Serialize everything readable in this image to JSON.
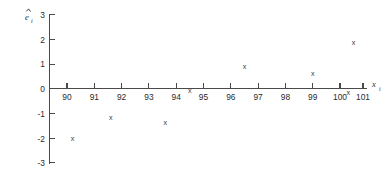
{
  "chart_data": {
    "type": "scatter",
    "title": "",
    "subtitle": "",
    "xlabel": "x",
    "xlabel_sub": "i",
    "ylabel": "e",
    "ylabel_sub": "i",
    "ylabel_accent": "hat",
    "xlim": [
      89.3,
      101.4
    ],
    "ylim": [
      -3,
      3
    ],
    "xticks": [
      90,
      91,
      92,
      93,
      94,
      95,
      96,
      97,
      98,
      99,
      100,
      101
    ],
    "xticklabels": [
      "90",
      "91",
      "92",
      "93",
      "94",
      "95",
      "96",
      "97",
      "98",
      "99",
      "100",
      "101"
    ],
    "yticks": [
      3,
      2,
      1,
      0,
      -1,
      -2,
      -3
    ],
    "yticklabels": [
      "3",
      "2",
      "1",
      "0",
      "-1",
      "-2",
      "-3"
    ],
    "grid": false,
    "legend": null,
    "marker": "x",
    "marker_color": "#3a3a3a",
    "axis_color": "#4a4a4a",
    "background": "#ffffff",
    "points": [
      {
        "x": 90.2,
        "y": -2.05
      },
      {
        "x": 91.6,
        "y": -1.2
      },
      {
        "x": 93.6,
        "y": -1.4
      },
      {
        "x": 94.5,
        "y": -0.12
      },
      {
        "x": 96.5,
        "y": 0.88
      },
      {
        "x": 99.0,
        "y": 0.57
      },
      {
        "x": 100.3,
        "y": -0.18
      },
      {
        "x": 100.5,
        "y": 1.82
      }
    ],
    "series": [
      {
        "name": "residuals",
        "x": [
          90.2,
          91.6,
          93.6,
          94.5,
          96.5,
          99.0,
          100.3,
          100.5
        ],
        "values": [
          -2.05,
          -1.2,
          -1.4,
          -0.12,
          0.88,
          0.57,
          -0.18,
          1.82
        ]
      }
    ]
  }
}
